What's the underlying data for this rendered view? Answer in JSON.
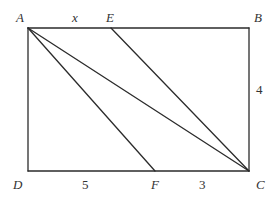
{
  "diagram": {
    "type": "geometry",
    "shape": "rectangle",
    "points": {
      "A": {
        "label": "A",
        "x": 28,
        "y": 28
      },
      "B": {
        "label": "B",
        "x": 249,
        "y": 28
      },
      "C": {
        "label": "C",
        "x": 249,
        "y": 171
      },
      "D": {
        "label": "D",
        "x": 28,
        "y": 171
      },
      "E": {
        "label": "E",
        "x": 111,
        "y": 28
      },
      "F": {
        "label": "F",
        "x": 155,
        "y": 171
      }
    },
    "segments": [
      [
        "A",
        "B"
      ],
      [
        "B",
        "C"
      ],
      [
        "C",
        "D"
      ],
      [
        "D",
        "A"
      ],
      [
        "A",
        "F"
      ],
      [
        "A",
        "C"
      ],
      [
        "E",
        "C"
      ]
    ],
    "measures": {
      "AE": "x",
      "BC": "4",
      "DF": "5",
      "FC": "3"
    }
  }
}
